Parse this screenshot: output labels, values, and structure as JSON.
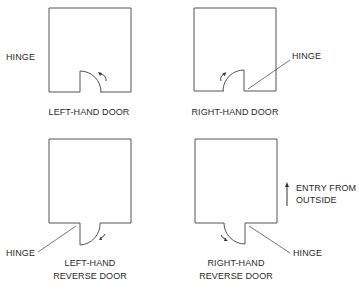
{
  "diagram": {
    "panels": [
      {
        "id": "left-hand-door",
        "caption": [
          "LEFT-HAND DOOR"
        ],
        "hinge_label": "HINGE",
        "swing": "inward",
        "hinge_side": "left"
      },
      {
        "id": "right-hand-door",
        "caption": [
          "RIGHT-HAND DOOR"
        ],
        "hinge_label": "HINGE",
        "swing": "inward",
        "hinge_side": "right"
      },
      {
        "id": "left-hand-reverse-door",
        "caption": [
          "LEFT-HAND",
          "REVERSE DOOR"
        ],
        "hinge_label": "HINGE",
        "swing": "outward",
        "hinge_side": "left"
      },
      {
        "id": "right-hand-reverse-door",
        "caption": [
          "RIGHT-HAND",
          "REVERSE DOOR"
        ],
        "hinge_label": "HINGE",
        "swing": "outward",
        "hinge_side": "right"
      }
    ],
    "entry_note": [
      "ENTRY FROM",
      "OUTSIDE"
    ],
    "entry_arrow": "up-arrow",
    "line_color": "#555555",
    "text_color": "#2a2a2a"
  }
}
